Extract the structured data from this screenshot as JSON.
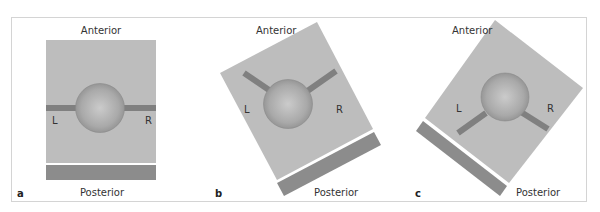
{
  "figure": {
    "colors": {
      "plate": "#bdbdbd",
      "bar": "#8c8c8c",
      "rod": "#808080",
      "sphere_light": "#c8c8c8",
      "sphere_dark": "#8e8e8e",
      "frame": "#d4d4d4"
    },
    "panels": [
      {
        "letter": "a",
        "top_label": "Anterior",
        "bottom_label": "Posterior",
        "left_label": "L",
        "right_label": "R",
        "rotation_deg": 0
      },
      {
        "letter": "b",
        "top_label": "Anterior",
        "bottom_label": "Posterior",
        "left_label": "L",
        "right_label": "R",
        "rotation_deg": -28
      },
      {
        "letter": "c",
        "top_label": "Anterior",
        "bottom_label": "Posterior",
        "left_label": "L",
        "right_label": "R",
        "rotation_deg": 37
      }
    ]
  }
}
